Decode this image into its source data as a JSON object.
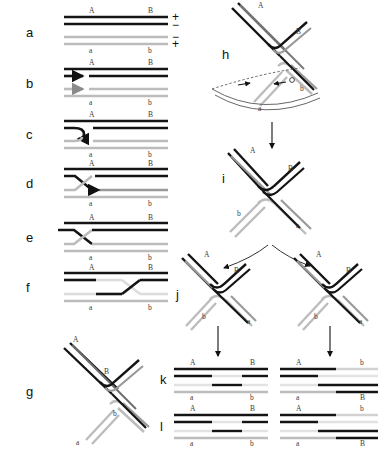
{
  "figure": {
    "type": "diagram",
    "panel_labels": [
      "a",
      "b",
      "c",
      "d",
      "e",
      "f",
      "g",
      "h",
      "i",
      "j",
      "k",
      "l"
    ],
    "strand_end_labels": {
      "upper_left": "A",
      "upper_right": "B",
      "lower_left": "a",
      "lower_right": "b"
    },
    "polarity_signs": [
      "+",
      "−",
      "−",
      "+"
    ],
    "colors": {
      "dark_strand": "#141414",
      "light_strand": "#b4b4b4",
      "mid_strand": "#6e6e6e",
      "label_text": "#3a3a3a",
      "panel_text": "#111111",
      "background": "#ffffff"
    }
  },
  "panels": {
    "a": {
      "label": "a",
      "caption_A": "A",
      "caption_B": "B",
      "caption_a": "a",
      "caption_b": "b",
      "sign_1": "+",
      "sign_2": "−",
      "sign_3": "−",
      "sign_4": "+"
    },
    "b": {
      "label": "b",
      "caption_A": "A",
      "caption_B": "B",
      "caption_a": "a",
      "caption_b": "b"
    },
    "c": {
      "label": "c",
      "caption_A": "A",
      "caption_B": "B",
      "caption_a": "a",
      "caption_b": "b"
    },
    "d": {
      "label": "d",
      "caption_A": "A",
      "caption_B": "B",
      "caption_a": "a",
      "caption_b": "b"
    },
    "e": {
      "label": "e",
      "caption_A": "A",
      "caption_B": "B",
      "caption_a": "a",
      "caption_b": "b"
    },
    "f": {
      "label": "f",
      "caption_A": "A",
      "caption_B": "B",
      "caption_a": "a",
      "caption_b": "b"
    },
    "g": {
      "label": "g",
      "caption_A": "A",
      "caption_B": "B",
      "caption_a": "a",
      "caption_b": "b"
    },
    "h": {
      "label": "h",
      "caption_A": "A",
      "caption_B": "B",
      "caption_a": "a",
      "caption_b": "b"
    },
    "i": {
      "label": "i",
      "caption_A": "A",
      "caption_B": "B",
      "caption_a": "a",
      "caption_b": "b"
    },
    "j": {
      "label": "j",
      "left": {
        "caption_A": "A",
        "caption_B": "B",
        "caption_a": "a",
        "caption_b": "b"
      },
      "right": {
        "caption_A": "A",
        "caption_B": "B",
        "caption_a": "a",
        "caption_b": "b"
      }
    },
    "k": {
      "label": "k",
      "left": {
        "caption_A": "A",
        "caption_B": "B",
        "caption_a": "a",
        "caption_b": "b"
      },
      "right": {
        "caption_A": "A",
        "caption_B": "b",
        "caption_a": "a",
        "caption_b": "B"
      }
    },
    "l": {
      "label": "l",
      "left": {
        "caption_A": "A",
        "caption_B": "B",
        "caption_a": "a",
        "caption_b": "b"
      },
      "right": {
        "caption_A": "A",
        "caption_B": "b",
        "caption_a": "a",
        "caption_b": "B"
      }
    }
  }
}
